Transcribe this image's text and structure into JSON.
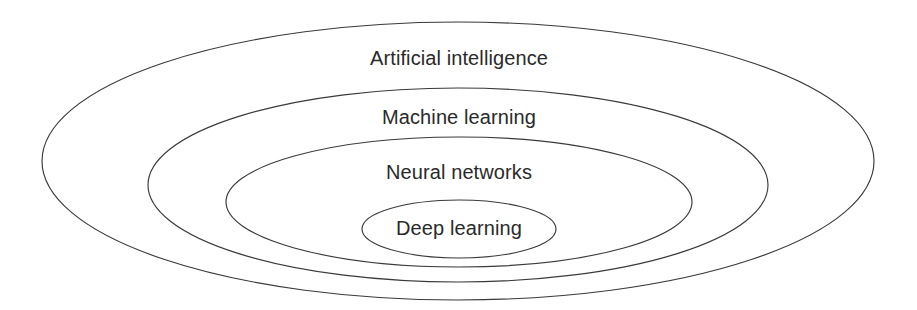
{
  "diagram": {
    "type": "nested-ellipses",
    "title": "",
    "background_color": "#ffffff",
    "stroke_color": "#3a3a3a",
    "text_color": "#2a2a2a",
    "canvas": {
      "width": 917,
      "height": 310
    },
    "rings": [
      {
        "label": "Artificial intelligence",
        "level": 1,
        "name": "artificial-intelligence",
        "cx": 458,
        "cy": 161,
        "rx": 416,
        "ry": 139,
        "label_x": 459,
        "label_y": 58
      },
      {
        "label": "Machine learning",
        "level": 2,
        "name": "machine-learning",
        "cx": 458,
        "cy": 185,
        "rx": 310,
        "ry": 97,
        "label_x": 459,
        "label_y": 117
      },
      {
        "label": "Neural networks",
        "level": 3,
        "name": "neural-networks",
        "cx": 459,
        "cy": 202,
        "rx": 233,
        "ry": 65,
        "label_x": 459,
        "label_y": 172
      },
      {
        "label": "Deep learning",
        "level": 4,
        "name": "deep-learning",
        "cx": 459,
        "cy": 229,
        "rx": 97,
        "ry": 29,
        "label_x": 459,
        "label_y": 228
      }
    ]
  }
}
